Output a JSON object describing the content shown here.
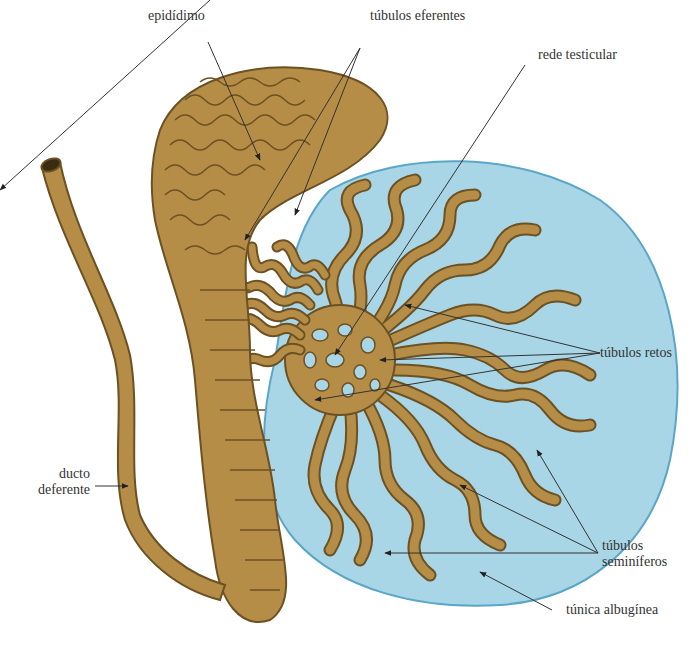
{
  "diagram": {
    "colors": {
      "tubule": "#b58d46",
      "tubule_edge": "#6b5123",
      "tunica_fill": "#a9d6e6",
      "tunica_edge": "#5aa6c8",
      "leader": "#333333",
      "text": "#333333"
    },
    "labels": {
      "epididimo": "epidídimo",
      "tubulos_eferentes": "túbulos eferentes",
      "rede_testicular": "rede testicular",
      "ducto_deferente_1": "ducto",
      "ducto_deferente_2": "deferente",
      "tubulos_retos": "túbulos retos",
      "tubulos_seminiferos_1": "túbulos",
      "tubulos_seminiferos_2": "seminíferos",
      "tunica_albuginea": "túnica albugínea"
    }
  }
}
